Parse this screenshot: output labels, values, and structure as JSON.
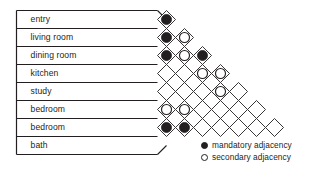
{
  "diagram": {
    "type": "triangular-adjacency-matrix",
    "stroke_color": "#231f20",
    "fill_color": "#231f20",
    "background_color": "#ffffff"
  },
  "rooms": [
    {
      "index": 0,
      "label": "entry"
    },
    {
      "index": 1,
      "label": "living room"
    },
    {
      "index": 2,
      "label": "dining room"
    },
    {
      "index": 3,
      "label": "kitchen"
    },
    {
      "index": 4,
      "label": "study"
    },
    {
      "index": 5,
      "label": "bedroom"
    },
    {
      "index": 6,
      "label": "bedroom"
    },
    {
      "index": 7,
      "label": "bath"
    }
  ],
  "legend": {
    "items": [
      {
        "marker": "filled-circle",
        "label": "mandatory adjacency"
      },
      {
        "marker": "open-circle",
        "label": "secondary adjacency"
      }
    ]
  },
  "chart_data": {
    "type": "heatmap",
    "categories": [
      "entry",
      "living room",
      "dining room",
      "kitchen",
      "study",
      "bedroom",
      "bedroom",
      "bath"
    ],
    "value_legend": {
      "mandatory": "filled-circle",
      "secondary": "open-circle",
      "none": "empty-cell"
    },
    "cells": [
      {
        "row": 0,
        "col": 0,
        "pair": [
          "entry",
          "living room"
        ],
        "value": "mandatory"
      },
      {
        "row": 1,
        "col": 0,
        "pair": [
          "living room",
          "dining room"
        ],
        "value": "mandatory"
      },
      {
        "row": 1,
        "col": 1,
        "pair": [
          "entry",
          "dining room"
        ],
        "value": "secondary"
      },
      {
        "row": 2,
        "col": 0,
        "pair": [
          "dining room",
          "kitchen"
        ],
        "value": "mandatory"
      },
      {
        "row": 2,
        "col": 1,
        "pair": [
          "living room",
          "kitchen"
        ],
        "value": "secondary"
      },
      {
        "row": 2,
        "col": 2,
        "pair": [
          "entry",
          "kitchen"
        ],
        "value": "mandatory"
      },
      {
        "row": 3,
        "col": 0,
        "pair": [
          "kitchen",
          "study"
        ],
        "value": "none"
      },
      {
        "row": 3,
        "col": 1,
        "pair": [
          "dining room",
          "study"
        ],
        "value": "none"
      },
      {
        "row": 3,
        "col": 2,
        "pair": [
          "living room",
          "study"
        ],
        "value": "secondary"
      },
      {
        "row": 3,
        "col": 3,
        "pair": [
          "entry",
          "study"
        ],
        "value": "secondary"
      },
      {
        "row": 4,
        "col": 0,
        "pair": [
          "study",
          "bedroom"
        ],
        "value": "none"
      },
      {
        "row": 4,
        "col": 1,
        "pair": [
          "kitchen",
          "bedroom"
        ],
        "value": "none"
      },
      {
        "row": 4,
        "col": 2,
        "pair": [
          "dining room",
          "bedroom"
        ],
        "value": "none"
      },
      {
        "row": 4,
        "col": 3,
        "pair": [
          "living room",
          "bedroom"
        ],
        "value": "secondary"
      },
      {
        "row": 4,
        "col": 4,
        "pair": [
          "entry",
          "bedroom"
        ],
        "value": "none"
      },
      {
        "row": 5,
        "col": 0,
        "pair": [
          "bedroom",
          "bedroom"
        ],
        "value": "secondary"
      },
      {
        "row": 5,
        "col": 1,
        "pair": [
          "study",
          "bedroom"
        ],
        "value": "secondary"
      },
      {
        "row": 5,
        "col": 2,
        "pair": [
          "kitchen",
          "bedroom"
        ],
        "value": "none"
      },
      {
        "row": 5,
        "col": 3,
        "pair": [
          "dining room",
          "bedroom"
        ],
        "value": "none"
      },
      {
        "row": 5,
        "col": 4,
        "pair": [
          "living room",
          "bedroom"
        ],
        "value": "none"
      },
      {
        "row": 5,
        "col": 5,
        "pair": [
          "entry",
          "bedroom"
        ],
        "value": "none"
      },
      {
        "row": 6,
        "col": 0,
        "pair": [
          "bedroom",
          "bath"
        ],
        "value": "mandatory"
      },
      {
        "row": 6,
        "col": 1,
        "pair": [
          "bedroom",
          "bath"
        ],
        "value": "mandatory"
      },
      {
        "row": 6,
        "col": 2,
        "pair": [
          "study",
          "bath"
        ],
        "value": "none"
      },
      {
        "row": 6,
        "col": 3,
        "pair": [
          "kitchen",
          "bath"
        ],
        "value": "none"
      },
      {
        "row": 6,
        "col": 4,
        "pair": [
          "dining room",
          "bath"
        ],
        "value": "none"
      },
      {
        "row": 6,
        "col": 5,
        "pair": [
          "living room",
          "bath"
        ],
        "value": "none"
      },
      {
        "row": 6,
        "col": 6,
        "pair": [
          "entry",
          "bath"
        ],
        "value": "none"
      }
    ],
    "xlabel": "",
    "ylabel": "",
    "grid": true,
    "legend_position": "bottom-right"
  }
}
